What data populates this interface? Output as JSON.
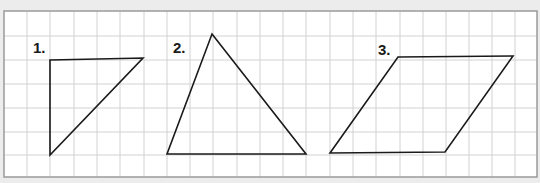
{
  "figure": {
    "width": 540,
    "height": 183,
    "colors": {
      "page_background": "#ececec",
      "grid_background": "#ffffff",
      "grid_line": "#d2d2d2",
      "border": "#9a9a9a",
      "shape_stroke": "#1a1a1a",
      "label": "#1a1a1a"
    },
    "grid": {
      "left": 4,
      "top": 11,
      "right": 537,
      "bottom": 177,
      "vertical_lines": [
        27,
        50,
        74,
        97,
        120,
        144,
        167,
        190,
        213,
        237,
        260,
        283,
        306,
        330,
        353,
        376,
        400,
        423,
        446,
        469,
        492,
        515
      ],
      "horizontal_lines": [
        36,
        60,
        84,
        108,
        132,
        155
      ]
    },
    "shapes": [
      {
        "label": "1.",
        "type": "right-triangle",
        "label_pos": [
          33,
          53
        ],
        "points": [
          [
            50,
            60
          ],
          [
            143,
            58
          ],
          [
            50,
            155
          ]
        ]
      },
      {
        "label": "2.",
        "type": "triangle",
        "label_pos": [
          173,
          53
        ],
        "points": [
          [
            212,
            34
          ],
          [
            306,
            154
          ],
          [
            167,
            154
          ]
        ]
      },
      {
        "label": "3.",
        "type": "parallelogram",
        "label_pos": [
          378,
          55
        ],
        "points": [
          [
            398,
            57
          ],
          [
            513,
            56
          ],
          [
            445,
            152
          ],
          [
            330,
            153
          ]
        ]
      }
    ]
  }
}
